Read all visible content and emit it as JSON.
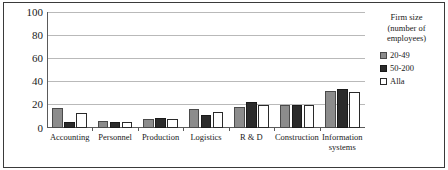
{
  "chart_data": {
    "type": "bar",
    "title": "",
    "subtitle": "",
    "xlabel": "",
    "ylabel": "",
    "ylim": [
      0,
      100
    ],
    "yticks": [
      0,
      20,
      40,
      60,
      80,
      100
    ],
    "grid": true,
    "legend_position": "right",
    "legend_title": "Firm size (number of employees)",
    "legend_title_lines": [
      "Firm size",
      "(number of",
      "employees)"
    ],
    "categories": [
      "Accounting",
      "Personnel",
      "Production",
      "Logistics",
      "R & D",
      "Construction",
      "Information systems"
    ],
    "category_lines": [
      [
        "Accounting"
      ],
      [
        "Personnel"
      ],
      [
        "Production"
      ],
      [
        "Logistics"
      ],
      [
        "R & D"
      ],
      [
        "Construction"
      ],
      [
        "Information",
        "systems"
      ]
    ],
    "series": [
      {
        "name": "20-49",
        "color": "#8c8c8c",
        "values": [
          17,
          6,
          8,
          16,
          18,
          20,
          32
        ]
      },
      {
        "name": "50-200",
        "color": "#2b2b2b",
        "values": [
          5,
          5,
          9,
          11,
          22,
          20,
          34
        ]
      },
      {
        "name": "Alla",
        "color": "#ffffff",
        "values": [
          13,
          5,
          8,
          14,
          20,
          20,
          31
        ]
      }
    ]
  },
  "colors": {
    "axis": "#5a5a5a",
    "grid": "#b9b9b9",
    "frame": "#3a3a3a",
    "text": "#1a1a1a",
    "background": "#ffffff"
  }
}
